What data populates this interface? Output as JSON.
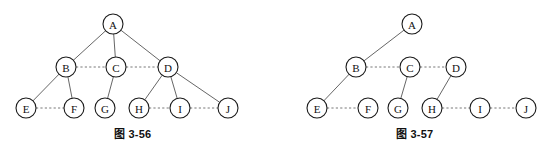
{
  "page": {
    "background": "#ffffff",
    "width": 544,
    "height": 158
  },
  "colors": {
    "node_stroke": "#1a1a1a",
    "node_fill": "#ffffff",
    "solid_edge": "#555555",
    "dashed_edge": "#6a6a6a",
    "text": "#111111"
  },
  "figures": [
    {
      "id": "figure-left",
      "caption": "图 3-56",
      "node_radius": 10,
      "nodes": [
        {
          "label": "A",
          "x": 113,
          "y": 24
        },
        {
          "label": "B",
          "x": 66,
          "y": 67
        },
        {
          "label": "C",
          "x": 116,
          "y": 67
        },
        {
          "label": "D",
          "x": 168,
          "y": 67
        },
        {
          "label": "E",
          "x": 26,
          "y": 108
        },
        {
          "label": "F",
          "x": 74,
          "y": 108
        },
        {
          "label": "G",
          "x": 105,
          "y": 108
        },
        {
          "label": "H",
          "x": 139,
          "y": 108
        },
        {
          "label": "I",
          "x": 180,
          "y": 108
        },
        {
          "label": "J",
          "x": 228,
          "y": 108
        }
      ],
      "solid_edges": [
        [
          "A",
          "B"
        ],
        [
          "A",
          "C"
        ],
        [
          "A",
          "D"
        ],
        [
          "B",
          "E"
        ],
        [
          "B",
          "F"
        ],
        [
          "C",
          "G"
        ],
        [
          "D",
          "H"
        ],
        [
          "D",
          "I"
        ],
        [
          "D",
          "J"
        ]
      ],
      "dashed_edges": [
        [
          "B",
          "C"
        ],
        [
          "C",
          "D"
        ],
        [
          "E",
          "F"
        ],
        [
          "H",
          "I"
        ],
        [
          "I",
          "J"
        ]
      ]
    },
    {
      "id": "figure-right",
      "caption": "图 3-57",
      "node_radius": 10,
      "nodes": [
        {
          "label": "A",
          "x": 412,
          "y": 24
        },
        {
          "label": "B",
          "x": 356,
          "y": 67
        },
        {
          "label": "C",
          "x": 410,
          "y": 67
        },
        {
          "label": "D",
          "x": 456,
          "y": 67
        },
        {
          "label": "E",
          "x": 317,
          "y": 108
        },
        {
          "label": "F",
          "x": 368,
          "y": 108
        },
        {
          "label": "G",
          "x": 398,
          "y": 108
        },
        {
          "label": "H",
          "x": 432,
          "y": 108
        },
        {
          "label": "I",
          "x": 480,
          "y": 108
        },
        {
          "label": "J",
          "x": 526,
          "y": 108
        }
      ],
      "solid_edges": [
        [
          "A",
          "B"
        ],
        [
          "B",
          "E"
        ],
        [
          "C",
          "G"
        ],
        [
          "D",
          "H"
        ]
      ],
      "dashed_edges": [
        [
          "B",
          "C"
        ],
        [
          "C",
          "D"
        ],
        [
          "E",
          "F"
        ],
        [
          "H",
          "I"
        ],
        [
          "I",
          "J"
        ]
      ]
    }
  ]
}
